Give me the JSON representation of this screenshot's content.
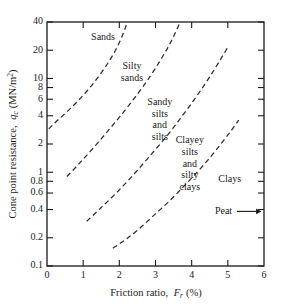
{
  "chart_data": {
    "type": "line",
    "title": "",
    "xlabel": "Friction ratio, Fr (%)",
    "ylabel": "Cone point resistance, qc (MN/m2)",
    "xlim": [
      0,
      6
    ],
    "ylim": [
      0.1,
      40
    ],
    "yscale": "log",
    "grid": false,
    "legend": "none",
    "xticks": [
      "0",
      "1",
      "2",
      "3",
      "4",
      "5",
      "6"
    ],
    "yticks": [
      "0.1",
      "0.2",
      "0.4",
      "0.6",
      "0.8",
      "1",
      "2",
      "4",
      "6",
      "8",
      "10",
      "20",
      "40"
    ],
    "annotations": [
      {
        "text": "Sands",
        "x": 1.55,
        "y": 26
      },
      {
        "text": "Silty",
        "x": 2.35,
        "y": 12.5
      },
      {
        "text": "sands",
        "x": 2.35,
        "y": 9.3
      },
      {
        "text": "Sandy",
        "x": 3.12,
        "y": 5.2
      },
      {
        "text": "silts",
        "x": 3.12,
        "y": 3.9
      },
      {
        "text": "and",
        "x": 3.12,
        "y": 2.95
      },
      {
        "text": "silts",
        "x": 3.12,
        "y": 2.2
      },
      {
        "text": "Clayey",
        "x": 3.95,
        "y": 2.05
      },
      {
        "text": "silts",
        "x": 3.95,
        "y": 1.52
      },
      {
        "text": "and",
        "x": 3.95,
        "y": 1.14
      },
      {
        "text": "silty",
        "x": 3.95,
        "y": 0.86
      },
      {
        "text": "clays",
        "x": 3.95,
        "y": 0.64
      },
      {
        "text": "Clays",
        "x": 5.05,
        "y": 0.78
      },
      {
        "text": "Peat",
        "x": 4.88,
        "y": 0.355
      }
    ],
    "series": [
      {
        "name": "sands-siltysands-boundary",
        "points": [
          [
            0.05,
            2.9
          ],
          [
            0.3,
            3.6
          ],
          [
            0.6,
            4.6
          ],
          [
            0.9,
            6.0
          ],
          [
            1.2,
            8.1
          ],
          [
            1.5,
            11.5
          ],
          [
            1.75,
            16.0
          ],
          [
            1.95,
            22.0
          ],
          [
            2.12,
            31.0
          ],
          [
            2.22,
            40.0
          ]
        ]
      },
      {
        "name": "siltysands-sandysilts-boundary",
        "points": [
          [
            0.55,
            0.9
          ],
          [
            0.9,
            1.25
          ],
          [
            1.3,
            1.85
          ],
          [
            1.7,
            2.8
          ],
          [
            2.1,
            4.3
          ],
          [
            2.5,
            6.8
          ],
          [
            2.85,
            10.5
          ],
          [
            3.15,
            16.0
          ],
          [
            3.4,
            23.5
          ],
          [
            3.6,
            34.0
          ],
          [
            3.68,
            40.0
          ]
        ]
      },
      {
        "name": "sandysilts-clayeysilts-boundary",
        "points": [
          [
            1.1,
            0.3
          ],
          [
            1.5,
            0.42
          ],
          [
            1.95,
            0.62
          ],
          [
            2.4,
            0.95
          ],
          [
            2.85,
            1.5
          ],
          [
            3.3,
            2.4
          ],
          [
            3.7,
            3.8
          ],
          [
            4.05,
            5.8
          ],
          [
            4.35,
            8.5
          ],
          [
            4.6,
            12.0
          ],
          [
            4.82,
            16.5
          ],
          [
            5.0,
            21.5
          ]
        ]
      },
      {
        "name": "clayeysilts-clays-boundary",
        "points": [
          [
            1.82,
            0.155
          ],
          [
            2.2,
            0.195
          ],
          [
            2.6,
            0.26
          ],
          [
            3.0,
            0.36
          ],
          [
            3.4,
            0.5
          ],
          [
            3.8,
            0.72
          ],
          [
            4.2,
            1.05
          ],
          [
            4.55,
            1.5
          ],
          [
            4.85,
            2.1
          ],
          [
            5.1,
            2.8
          ],
          [
            5.3,
            3.6
          ]
        ]
      }
    ],
    "peat_arrow": {
      "from_x": 5.25,
      "to_x": 5.92,
      "y": 0.355
    }
  },
  "axes": {
    "x_title_main": "Friction ratio,",
    "x_title_var": "F",
    "x_title_sub": "r",
    "x_title_unit": "(%)",
    "y_title_main": "Cone point resistance,",
    "y_title_var": "q",
    "y_title_sub": "c",
    "y_title_unit_open": "(MN/m",
    "y_title_unit_sup": "2",
    "y_title_unit_close": ")"
  }
}
